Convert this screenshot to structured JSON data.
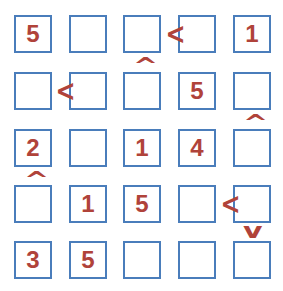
{
  "puzzle": {
    "type": "futoshiki",
    "size": 5,
    "colors": {
      "cell_border": "#4a7dbb",
      "digit": "#b0433a",
      "sign": "#b0433a"
    },
    "grid": [
      [
        "5",
        "",
        "",
        "",
        "1"
      ],
      [
        "",
        "",
        "",
        "5",
        ""
      ],
      [
        "2",
        "",
        "1",
        "4",
        ""
      ],
      [
        "",
        "1",
        "5",
        "",
        ""
      ],
      [
        "3",
        "5",
        "",
        "",
        ""
      ]
    ],
    "signs": {
      "r1c3_c4": "<",
      "r2c1_c2": "<",
      "r4c4_c5": "<",
      "r1r2_c3": "^",
      "r2r3_c5": "^",
      "r3r4_c1": "^",
      "r4r5_c5": "v"
    },
    "sign_glyphs": {
      "lt": "<",
      "up": "^",
      "down": "v"
    }
  }
}
